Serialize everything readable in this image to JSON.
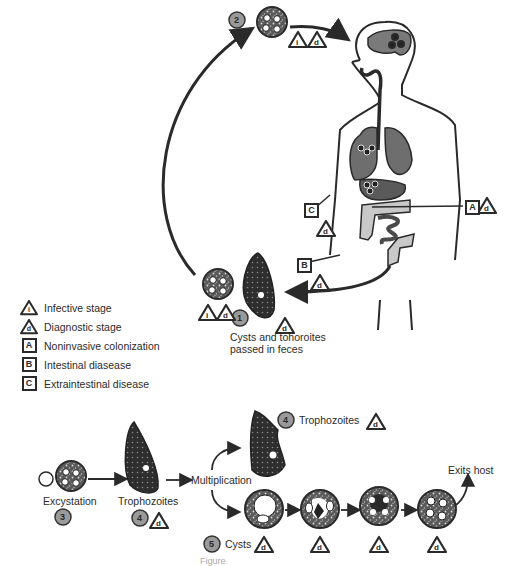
{
  "diagram": {
    "type": "parasite-life-cycle",
    "legend": [
      {
        "icon": "infective-stage-icon",
        "symbol": "i",
        "label": "Infective stage"
      },
      {
        "icon": "diagnostic-stage-icon",
        "symbol": "d",
        "label": "Diagnostic stage"
      },
      {
        "icon": "box-A-icon",
        "symbol": "A",
        "label": "Noninvasive colonization"
      },
      {
        "icon": "box-B-icon",
        "symbol": "B",
        "label": "Intestinal diasease"
      },
      {
        "icon": "box-C-icon",
        "symbol": "C",
        "label": "Extraintestinal disease"
      }
    ],
    "steps": {
      "s1": {
        "number": "1",
        "label_line1": "Cysts and tohoroites",
        "label_line2": "passed in feces"
      },
      "s2": {
        "number": "2"
      },
      "s3": {
        "number": "3",
        "label": "Excystation"
      },
      "s4a": {
        "number": "4",
        "label": "Trophozoites"
      },
      "s4b": {
        "number": "4",
        "label": "Trophozoites"
      },
      "s5": {
        "number": "5",
        "label": "Cysts"
      }
    },
    "flow_labels": {
      "multiplication": "Multiplication",
      "exits_host": "Exits host"
    },
    "body_markers": {
      "A": "A",
      "B": "B",
      "C": "C"
    },
    "symbols": {
      "infective": "i",
      "diagnostic": "d"
    },
    "caption": "Figure"
  }
}
